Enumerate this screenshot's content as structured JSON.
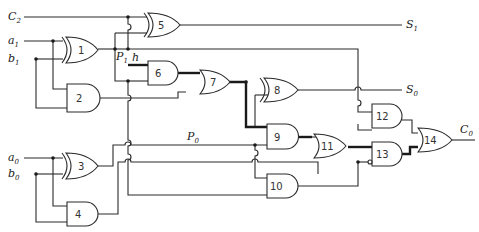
{
  "diagram": {
    "type": "logic-circuit",
    "inputs": {
      "c2": {
        "name": "C",
        "sub": "2"
      },
      "a1": {
        "name": "a",
        "sub": "1"
      },
      "b1": {
        "name": "b",
        "sub": "1"
      },
      "a0": {
        "name": "a",
        "sub": "0"
      },
      "b0": {
        "name": "b",
        "sub": "0"
      }
    },
    "outputs": {
      "s1": {
        "name": "S",
        "sub": "1"
      },
      "s0": {
        "name": "S",
        "sub": "0"
      },
      "c0": {
        "name": "C",
        "sub": "0"
      }
    },
    "signals": {
      "p1": {
        "name": "P",
        "sub": "1"
      },
      "h": {
        "name": "h"
      },
      "p0": {
        "name": "P",
        "sub": "0"
      }
    },
    "gates": [
      {
        "id": "1",
        "type": "XOR"
      },
      {
        "id": "2",
        "type": "AND"
      },
      {
        "id": "3",
        "type": "XOR"
      },
      {
        "id": "4",
        "type": "AND"
      },
      {
        "id": "5",
        "type": "XOR"
      },
      {
        "id": "6",
        "type": "AND"
      },
      {
        "id": "7",
        "type": "OR"
      },
      {
        "id": "8",
        "type": "XOR"
      },
      {
        "id": "9",
        "type": "AND"
      },
      {
        "id": "10",
        "type": "AND"
      },
      {
        "id": "11",
        "type": "OR"
      },
      {
        "id": "12",
        "type": "AND"
      },
      {
        "id": "13",
        "type": "AND",
        "note": "inverted lower input"
      },
      {
        "id": "14",
        "type": "OR"
      }
    ]
  }
}
